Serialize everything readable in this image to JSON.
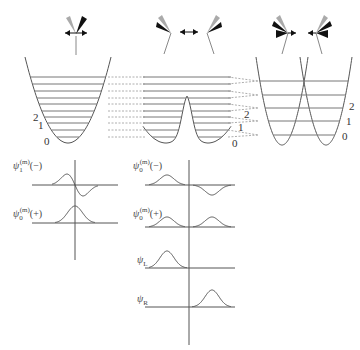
{
  "figure": {
    "molecule_icons": [
      {
        "id": "single-well-molecule",
        "motion": "symmetric-bending"
      },
      {
        "id": "double-well-molecule-left",
        "motion": "inversion"
      },
      {
        "id": "double-well-molecule-right",
        "motion": "inversion"
      },
      {
        "id": "separate-wells-molecule-left",
        "motion": "localized"
      },
      {
        "id": "separate-wells-molecule-right",
        "motion": "localized"
      }
    ],
    "potentials": [
      {
        "id": "single-well",
        "type": "harmonic",
        "level_labels": [
          "2",
          "1",
          "0"
        ],
        "level_count": 10
      },
      {
        "id": "double-well",
        "type": "double-well",
        "level_labels": [
          "2",
          "1",
          "0"
        ],
        "level_count": 10
      },
      {
        "id": "separated-wells",
        "type": "two-harmonic",
        "level_labels": [
          "2",
          "1",
          "0"
        ],
        "level_count": 5
      }
    ],
    "correlation_lines": "dashed",
    "wavefunction_panels": {
      "left": [
        {
          "label_base": "ψ",
          "label_sub": "1",
          "label_sup": "(m)",
          "label_suffix": "(−)",
          "shape": "antisymmetric"
        },
        {
          "label_base": "ψ",
          "label_sub": "0",
          "label_sup": "(m)",
          "label_suffix": "(+)",
          "shape": "symmetric-single"
        }
      ],
      "right": [
        {
          "label_base": "ψ",
          "label_sub": "0",
          "label_sup": "(m)",
          "label_suffix": "(−)",
          "shape": "antisymmetric-double"
        },
        {
          "label_base": "ψ",
          "label_sub": "0",
          "label_sup": "(m)",
          "label_suffix": "(+)",
          "shape": "symmetric-double"
        },
        {
          "label_base": "ψ",
          "label_sub": "L",
          "label_sup": "",
          "label_suffix": "",
          "shape": "left-localized"
        },
        {
          "label_base": "ψ",
          "label_sub": "R",
          "label_sup": "",
          "label_suffix": "",
          "shape": "right-localized"
        }
      ]
    }
  },
  "colors": {
    "line": "#555555",
    "level": "#777777",
    "dashed": "#999999",
    "dark_blade": "#111111",
    "light_blade": "#aaaaaa"
  }
}
